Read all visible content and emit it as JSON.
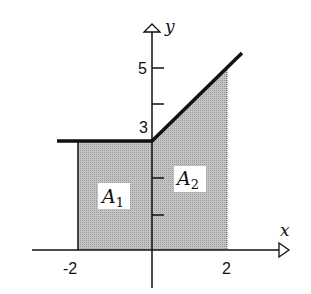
{
  "diagram": {
    "axes": {
      "x_label": "x",
      "y_label": "y",
      "x_ticks": [
        {
          "value": -2,
          "label": "-2"
        },
        {
          "value": 2,
          "label": "2"
        }
      ],
      "y_ticks": [
        {
          "value": 1,
          "label": ""
        },
        {
          "value": 2,
          "label": ""
        },
        {
          "value": 3,
          "label": "3"
        },
        {
          "value": 4,
          "label": ""
        },
        {
          "value": 5,
          "label": "5"
        }
      ]
    },
    "regions": [
      {
        "name": "A1",
        "label": "A",
        "subscript": "1",
        "x_range": [
          -2,
          0
        ],
        "height": 3
      },
      {
        "name": "A2",
        "label": "A",
        "subscript": "2",
        "x_range": [
          0,
          2
        ],
        "top": "y = 3 + x"
      }
    ],
    "graph": {
      "description": "f(x) = 3 for x < 0, f(x) = 3 + x for x >= 0",
      "shade_color": "#b8b8b8",
      "line_color": "#111111"
    }
  }
}
